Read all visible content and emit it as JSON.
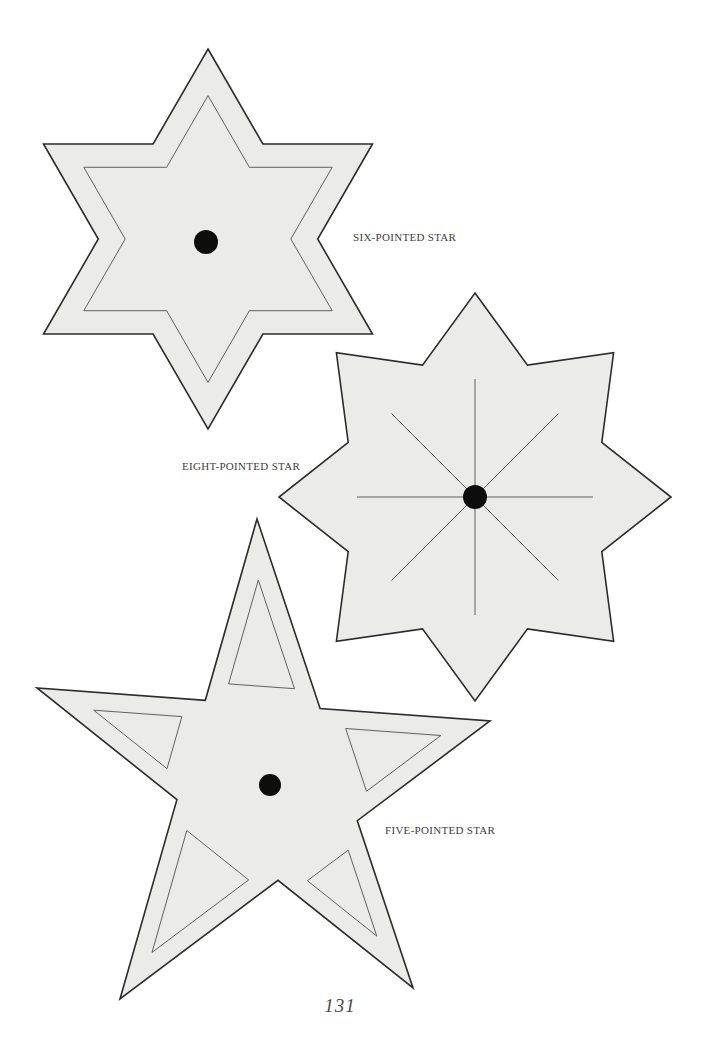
{
  "page": {
    "page_number": "131",
    "background_color": "#ffffff"
  },
  "colors": {
    "star_fill": "#ebebe9",
    "outline": "#2c2c2c",
    "guide_line": "#616161",
    "dot": "#0d0d0d",
    "label_text": "#414141",
    "page_number_text": "#4a4a4a"
  },
  "stars": [
    {
      "name": "six-pointed-star",
      "label": "SIX-POINTED STAR",
      "shape": {
        "kind": "regular",
        "points": 6,
        "cx": 208,
        "cy": 239,
        "outerRx": 190,
        "outerRy": 190,
        "innerRatio": 0.5774,
        "rotationDeg": 90
      },
      "inner_outline_scale": 0.755,
      "dot": {
        "cx": 206,
        "cy": 242,
        "r": 12
      }
    },
    {
      "name": "eight-pointed-star",
      "label": "EIGHT-POINTED STAR",
      "shape": {
        "kind": "regular",
        "points": 8,
        "cx": 475,
        "cy": 497,
        "outerRx": 196,
        "outerRy": 204,
        "innerRatio": 0.7,
        "rotationDeg": 90
      },
      "spokes": {
        "count": 8,
        "length": 118
      },
      "dot": {
        "cx": 475,
        "cy": 497,
        "r": 12
      }
    },
    {
      "name": "five-pointed-star",
      "label": "FIVE-POINTED STAR",
      "shape": {
        "kind": "pentagram",
        "tips": [
          [
            257,
            519
          ],
          [
            490,
            721
          ],
          [
            413,
            988
          ],
          [
            120,
            999
          ],
          [
            37,
            688
          ]
        ]
      },
      "arm_guide_inset": 18,
      "dot": {
        "cx": 270,
        "cy": 785,
        "r": 11
      }
    }
  ]
}
